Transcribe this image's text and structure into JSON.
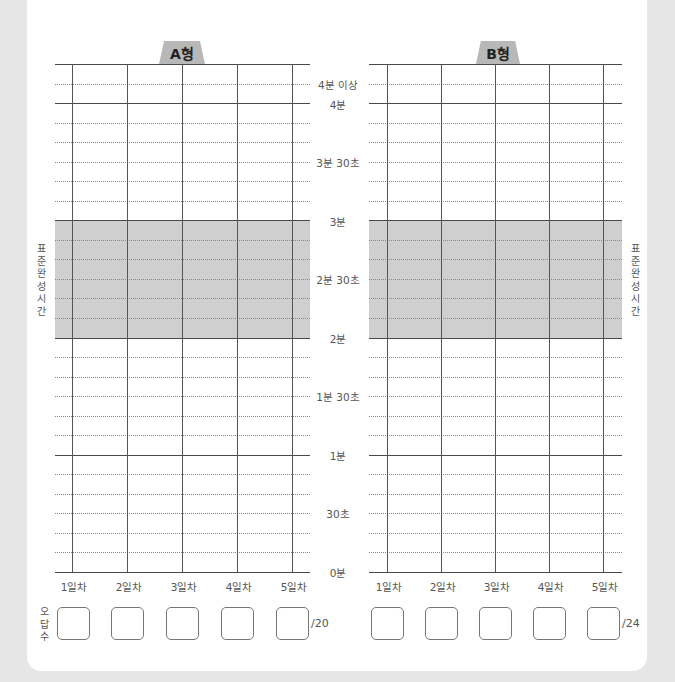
{
  "charts": [
    {
      "id": "A",
      "tab_label": "A형",
      "day_labels": [
        "1일차",
        "2일차",
        "3일차",
        "4일차",
        "5일차"
      ],
      "error_total": "/20",
      "side_label": "표준완성시간"
    },
    {
      "id": "B",
      "tab_label": "B형",
      "day_labels": [
        "1일차",
        "2일차",
        "3일차",
        "4일차",
        "5일차"
      ],
      "error_total": "/24",
      "side_label": "표준완성시간"
    }
  ],
  "y_axis_labels": [
    "4분 이상",
    "4분",
    "3분 30초",
    "3분",
    "2분 30초",
    "2분",
    "1분 30초",
    "1분",
    "30초",
    "0분"
  ],
  "error_count_label": "오답수",
  "standard_time_band": {
    "from": "2분",
    "to": "3분"
  },
  "colors": {
    "page_bg": "#e6e6e6",
    "card_bg": "#ffffff",
    "band": "#cfcfcf",
    "tab": "#b8b8b8",
    "line": "#4a4a4a"
  }
}
